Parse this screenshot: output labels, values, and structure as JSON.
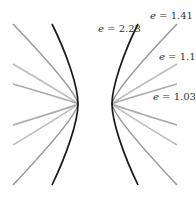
{
  "diagram": {
    "center": {
      "x": 95,
      "y": 104
    },
    "curves": [
      {
        "name": "e=1.41",
        "eccentricity": "1.41",
        "color": "#9a9a9a",
        "left_vertex": [
          78,
          104
        ],
        "right_vertex": [
          112,
          104
        ],
        "left_ends": [
          [
            13,
            24
          ],
          [
            13,
            185
          ]
        ],
        "right_ends": [
          [
            177,
            24
          ],
          [
            177,
            185
          ]
        ]
      },
      {
        "name": "e=1.1",
        "eccentricity": "1.1",
        "color": "#bdbdbd",
        "left_vertex": [
          78,
          104
        ],
        "right_vertex": [
          112,
          104
        ],
        "left_ends": [
          [
            13,
            64
          ],
          [
            13,
            145
          ]
        ],
        "right_ends": [
          [
            177,
            64
          ],
          [
            177,
            145
          ]
        ]
      },
      {
        "name": "e=1.03",
        "eccentricity": "1.03",
        "color": "#ababab",
        "left_vertex": [
          78,
          104
        ],
        "right_vertex": [
          112,
          104
        ],
        "left_ends": [
          [
            13,
            84
          ],
          [
            13,
            125
          ]
        ],
        "right_ends": [
          [
            177,
            84
          ],
          [
            177,
            125
          ]
        ]
      },
      {
        "name": "e=2.23",
        "eccentricity": "2.23",
        "color": "#1a1a1a",
        "left_vertex": [
          78,
          104
        ],
        "right_vertex": [
          112,
          104
        ],
        "left_ends": [
          [
            52,
            24
          ],
          [
            52,
            185
          ]
        ],
        "right_ends": [
          [
            138,
            24
          ],
          [
            138,
            185
          ]
        ]
      }
    ],
    "labels": [
      {
        "id": "label-e223",
        "var": "e",
        "eq": " = 2.23",
        "x": 98,
        "y": 32
      },
      {
        "id": "label-e141",
        "var": "e",
        "eq": " = 1.41",
        "x": 150,
        "y": 19
      },
      {
        "id": "label-e11",
        "var": "e",
        "eq": " = 1.1",
        "x": 159,
        "y": 60
      },
      {
        "id": "label-e103",
        "var": "e",
        "eq": " = 1.03",
        "x": 153,
        "y": 100
      }
    ]
  }
}
